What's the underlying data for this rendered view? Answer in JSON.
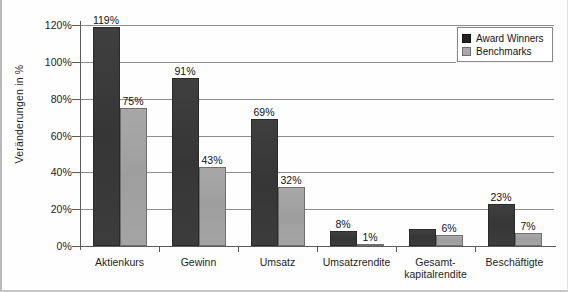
{
  "chart_data": {
    "type": "bar",
    "title": "",
    "xlabel": "",
    "ylabel": "Veränderungen in  %",
    "ylim": [
      0,
      125
    ],
    "ytick_labels": [
      "0%",
      "20%",
      "40%",
      "60%",
      "80%",
      "100%",
      "120%"
    ],
    "ytick_values": [
      0,
      20,
      40,
      60,
      80,
      100,
      120
    ],
    "grid": true,
    "grid_axis": "y",
    "legend_position": "top-right",
    "categories": [
      "Aktienkurs",
      "Gewinn",
      "Umsatz",
      "Umsatzrendite",
      "Gesamt-\nkapitalrendite",
      "Beschäftigte"
    ],
    "series": [
      {
        "name": "Award Winners",
        "color": "#3a3a3a",
        "values": [
          119,
          91,
          69,
          8,
          9,
          23
        ],
        "labels": [
          "119%",
          "91%",
          "69%",
          "8%",
          "",
          "23%"
        ]
      },
      {
        "name": "Benchmarks",
        "color": "#a2a2a2",
        "values": [
          75,
          43,
          32,
          1,
          6,
          7
        ],
        "labels": [
          "75%",
          "43%",
          "32%",
          "1%",
          "6%",
          "7%"
        ]
      }
    ]
  },
  "legend": {
    "items": [
      {
        "label": "Award Winners",
        "swatch": "award-winners-swatch"
      },
      {
        "label": "Benchmarks",
        "swatch": "benchmarks-swatch"
      }
    ]
  }
}
